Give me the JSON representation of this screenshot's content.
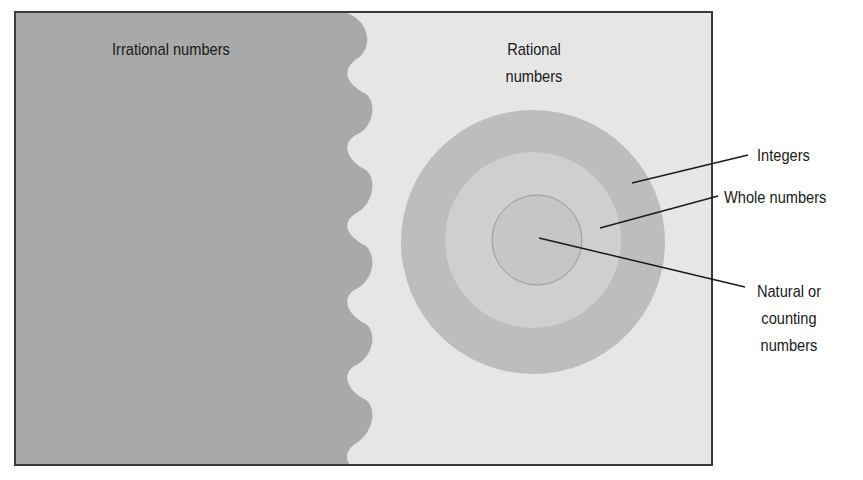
{
  "diagram": {
    "title_left": "Irrational numbers",
    "title_right_line1": "Rational",
    "title_right_line2": "numbers",
    "callouts": {
      "integers": "Integers",
      "whole": "Whole numbers",
      "natural_line1": "Natural or",
      "natural_line2": "counting",
      "natural_line3": "numbers"
    },
    "colors": {
      "irrational_fill": "#a9a9a9",
      "rational_fill": "#e6e6e6",
      "integers_ring": "#bdbdbd",
      "whole_ring": "#cfcfcf",
      "natural_core": "#c6c6c6",
      "frame": "#3a3a3a",
      "leader_line": "#1a1a1a"
    }
  }
}
